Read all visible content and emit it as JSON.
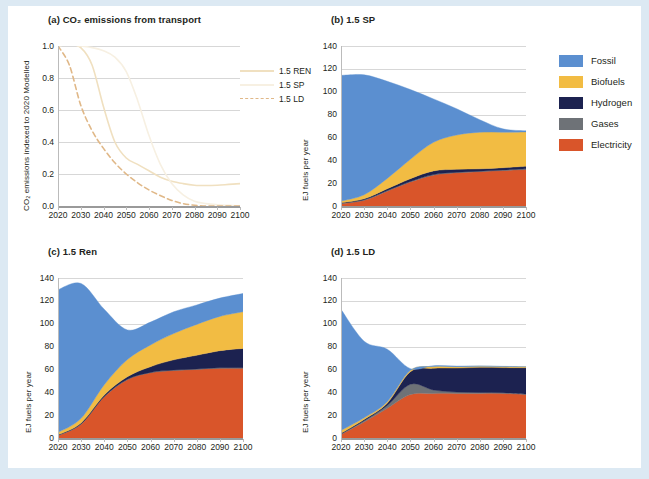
{
  "figure": {
    "background": "#dce9f3",
    "panel_background": "#ffffff"
  },
  "legend_lines": {
    "items": [
      {
        "label": "1.5 REN",
        "color": "#f0e0c0",
        "dash": "none"
      },
      {
        "label": "1.5 SP",
        "color": "#f7f0e2",
        "dash": "none"
      },
      {
        "label": "1.5 LD",
        "color": "#e0b888",
        "dash": "dashed"
      }
    ]
  },
  "legend_fills": {
    "items": [
      {
        "label": "Fossil",
        "color": "#5b8fd0"
      },
      {
        "label": "Biofuels",
        "color": "#f2bc43"
      },
      {
        "label": "Hydrogen",
        "color": "#1c2250"
      },
      {
        "label": "Gases",
        "color": "#6e7277"
      },
      {
        "label": "Electricity",
        "color": "#d9552a"
      }
    ]
  },
  "chart_data": [
    {
      "id": "panel-a",
      "type": "line",
      "title": "(a) CO₂ emissions from transport",
      "xlabel": "",
      "ylabel": "CO₂ emissions indexed to 2020 Modelled",
      "x": [
        2020,
        2030,
        2040,
        2050,
        2060,
        2070,
        2080,
        2090,
        2100
      ],
      "xlim": [
        2020,
        2100
      ],
      "ylim": [
        0.0,
        1.0
      ],
      "yticks": [
        0.0,
        0.2,
        0.4,
        0.6,
        0.8,
        1.0
      ],
      "ytick_labels": [
        "0.0",
        "0.2",
        "0.4",
        "0.6",
        "0.8",
        "1.0"
      ],
      "xticks": [
        2020,
        2030,
        2040,
        2050,
        2060,
        2070,
        2080,
        2090,
        2100
      ],
      "xtick_labels": [
        "2020",
        "2030",
        "2040",
        "2050",
        "2060",
        "2070",
        "2080",
        "2090",
        "2100"
      ],
      "grid": true,
      "legend_position": "right",
      "series": [
        {
          "name": "1.5 REN",
          "color": "#f0e0c0",
          "dash": "none",
          "xs": [
            2020,
            2025,
            2030,
            2035,
            2040,
            2045,
            2050,
            2055,
            2060,
            2065,
            2070,
            2075,
            2080,
            2085,
            2090,
            2095,
            2100
          ],
          "values": [
            1.0,
            1.01,
            0.99,
            0.88,
            0.62,
            0.4,
            0.3,
            0.26,
            0.22,
            0.18,
            0.155,
            0.14,
            0.13,
            0.128,
            0.13,
            0.135,
            0.14
          ]
        },
        {
          "name": "1.5 SP",
          "color": "#f7f0e2",
          "dash": "none",
          "xs": [
            2020,
            2025,
            2030,
            2035,
            2040,
            2045,
            2050,
            2055,
            2060,
            2065,
            2070,
            2075,
            2080,
            2085,
            2090,
            2095,
            2100
          ],
          "values": [
            1.0,
            1.01,
            1.0,
            0.99,
            0.97,
            0.93,
            0.84,
            0.66,
            0.44,
            0.26,
            0.14,
            0.07,
            0.03,
            0.015,
            0.008,
            0.004,
            0.0
          ]
        },
        {
          "name": "1.5 LD",
          "color": "#e0b888",
          "dash": "dashed",
          "xs": [
            2020,
            2025,
            2030,
            2035,
            2040,
            2045,
            2050,
            2055,
            2060,
            2065,
            2070,
            2075,
            2080,
            2085,
            2090,
            2095,
            2100
          ],
          "values": [
            1.0,
            0.88,
            0.63,
            0.47,
            0.36,
            0.27,
            0.2,
            0.145,
            0.1,
            0.065,
            0.035,
            0.015,
            0.005,
            0.0,
            0.0,
            0.0,
            0.0
          ]
        }
      ]
    },
    {
      "id": "panel-b",
      "type": "area",
      "title": "(b) 1.5 SP",
      "xlabel": "",
      "ylabel": "EJ fuels per year",
      "stacked": true,
      "x": [
        2020,
        2030,
        2040,
        2050,
        2060,
        2070,
        2080,
        2090,
        2100
      ],
      "xlim": [
        2020,
        2100
      ],
      "ylim": [
        0,
        140
      ],
      "yticks": [
        0,
        20,
        40,
        60,
        80,
        100,
        120,
        140
      ],
      "ytick_labels": [
        "0",
        "20",
        "40",
        "60",
        "80",
        "100",
        "120",
        "140"
      ],
      "xticks": [
        2020,
        2030,
        2040,
        2050,
        2060,
        2070,
        2080,
        2090,
        2100
      ],
      "xtick_labels": [
        "2020",
        "2030",
        "2040",
        "2050",
        "2060",
        "2070",
        "2080",
        "2090",
        "2100"
      ],
      "grid": true,
      "series": [
        {
          "name": "Electricity",
          "color": "#d9552a",
          "values": [
            2,
            5,
            13,
            21,
            27,
            29,
            30,
            31,
            32
          ]
        },
        {
          "name": "Gases",
          "color": "#6e7277",
          "values": [
            0.5,
            0.5,
            0.5,
            0.5,
            0.5,
            0.5,
            0.5,
            0.5,
            0.5
          ]
        },
        {
          "name": "Hydrogen",
          "color": "#1c2250",
          "values": [
            0.3,
            0.8,
            1.6,
            2.4,
            3.2,
            2.6,
            2.0,
            2.0,
            2.3
          ]
        },
        {
          "name": "Biofuels",
          "color": "#f2bc43",
          "values": [
            1.5,
            3.5,
            9,
            17,
            25,
            30,
            32,
            31,
            30
          ]
        },
        {
          "name": "Fossil",
          "color": "#5b8fd0",
          "values": [
            110,
            105,
            85,
            61,
            38,
            23,
            11,
            3,
            1
          ]
        }
      ],
      "totals": [
        114,
        115,
        109,
        102,
        94,
        85,
        76,
        68,
        66
      ]
    },
    {
      "id": "panel-c",
      "type": "area",
      "title": "(c) 1.5 Ren",
      "xlabel": "",
      "ylabel": "EJ fuels per year",
      "stacked": true,
      "x": [
        2020,
        2030,
        2040,
        2050,
        2060,
        2070,
        2080,
        2090,
        2100
      ],
      "xlim": [
        2020,
        2100
      ],
      "ylim": [
        0,
        140
      ],
      "yticks": [
        0,
        20,
        40,
        60,
        80,
        100,
        120,
        140
      ],
      "ytick_labels": [
        "0",
        "20",
        "40",
        "60",
        "80",
        "100",
        "120",
        "140"
      ],
      "xticks": [
        2020,
        2030,
        2040,
        2050,
        2060,
        2070,
        2080,
        2090,
        2100
      ],
      "xtick_labels": [
        "2020",
        "2030",
        "2040",
        "2050",
        "2060",
        "2070",
        "2080",
        "2090",
        "2100"
      ],
      "grid": true,
      "series": [
        {
          "name": "Electricity",
          "color": "#d9552a",
          "values": [
            2,
            12,
            36,
            51,
            57,
            59,
            60,
            61,
            61
          ]
        },
        {
          "name": "Gases",
          "color": "#6e7277",
          "values": [
            0.4,
            0.4,
            0.4,
            0.4,
            0.4,
            0.4,
            0.4,
            0.4,
            0.4
          ]
        },
        {
          "name": "Hydrogen",
          "color": "#1c2250",
          "values": [
            0.4,
            0.8,
            1.2,
            2.2,
            5,
            9,
            12,
            15,
            17
          ]
        },
        {
          "name": "Biofuels",
          "color": "#f2bc43",
          "values": [
            2,
            4,
            9,
            15,
            19,
            23,
            27,
            30,
            32
          ]
        },
        {
          "name": "Fossil",
          "color": "#5b8fd0",
          "values": [
            125,
            118,
            66,
            26,
            20,
            19,
            17,
            16,
            16
          ]
        }
      ],
      "totals": [
        130,
        135,
        113,
        95,
        101,
        110,
        116,
        122,
        127
      ]
    },
    {
      "id": "panel-d",
      "type": "area",
      "title": "(d) 1.5 LD",
      "xlabel": "",
      "ylabel": "EJ fuels per year",
      "stacked": true,
      "x": [
        2020,
        2030,
        2040,
        2050,
        2060,
        2070,
        2080,
        2090,
        2100
      ],
      "xlim": [
        2020,
        2100
      ],
      "ylim": [
        0,
        140
      ],
      "yticks": [
        0,
        20,
        40,
        60,
        80,
        100,
        120,
        140
      ],
      "ytick_labels": [
        "0",
        "20",
        "40",
        "60",
        "80",
        "100",
        "120",
        "140"
      ],
      "xticks": [
        2020,
        2030,
        2040,
        2050,
        2060,
        2070,
        2080,
        2090,
        2100
      ],
      "xtick_labels": [
        "2020",
        "2030",
        "2040",
        "2050",
        "2060",
        "2070",
        "2080",
        "2090",
        "2100"
      ],
      "grid": true,
      "series": [
        {
          "name": "Electricity",
          "color": "#d9552a",
          "values": [
            3,
            14,
            26,
            38,
            39,
            39,
            39,
            39,
            38
          ]
        },
        {
          "name": "Gases",
          "color": "#6e7277",
          "values": [
            0.6,
            1.2,
            2.5,
            9,
            3,
            1.2,
            0.8,
            0.6,
            0.5
          ]
        },
        {
          "name": "Hydrogen",
          "color": "#1c2250",
          "values": [
            0.5,
            1,
            2,
            11,
            19,
            21,
            22,
            22,
            23
          ]
        },
        {
          "name": "Biofuels",
          "color": "#f2bc43",
          "values": [
            2.5,
            1.5,
            1.2,
            1.2,
            1.5,
            1.2,
            1.0,
            0.9,
            0.8
          ]
        },
        {
          "name": "Fossil",
          "color": "#5b8fd0",
          "values": [
            106,
            67,
            46,
            1.5,
            0.8,
            0.5,
            0.3,
            0.2,
            0.1
          ]
        }
      ],
      "totals": [
        113,
        85,
        78,
        61,
        63,
        63,
        63,
        63,
        62
      ]
    }
  ]
}
